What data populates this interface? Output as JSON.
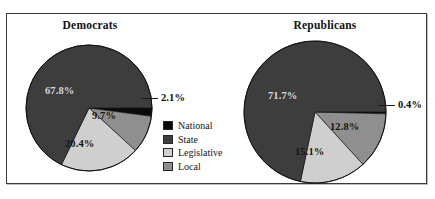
{
  "figure": {
    "background": "#ffffff",
    "frame_color": "#3a3a3a"
  },
  "legend": {
    "name": "chart-legend",
    "items": [
      {
        "label": "National",
        "color": "#0a0a0a"
      },
      {
        "label": "State",
        "color": "#3d3d3d"
      },
      {
        "label": "Legislative",
        "color": "#cfcfcf"
      },
      {
        "label": "Local",
        "color": "#8f8f8f"
      }
    ]
  },
  "charts": {
    "democrats": {
      "title": "Democrats",
      "labels": {
        "national": "2.1%",
        "local": "9.7%",
        "legislative": "20.4%",
        "state": "67.8%"
      }
    },
    "republicans": {
      "title": "Republicans",
      "labels": {
        "national": "0.4%",
        "local": "12.8%",
        "legislative": "15.1%",
        "state": "71.7%"
      }
    }
  },
  "chart_data": [
    {
      "type": "pie",
      "title": "Democrats",
      "categories": [
        "National",
        "Local",
        "Legislative",
        "State"
      ],
      "values": [
        2.1,
        9.7,
        20.4,
        67.8
      ],
      "value_labels": [
        "2.1%",
        "9.7%",
        "20.4%",
        "67.8%"
      ],
      "colors": [
        "#0a0a0a",
        "#8f8f8f",
        "#cfcfcf",
        "#3d3d3d"
      ],
      "units": "percent",
      "start_angle_deg": 0,
      "direction": "clockwise",
      "legend": [
        "National",
        "State",
        "Legislative",
        "Local"
      ],
      "legend_position": "center",
      "grid": false
    },
    {
      "type": "pie",
      "title": "Republicans",
      "categories": [
        "National",
        "Local",
        "Legislative",
        "State"
      ],
      "values": [
        0.4,
        12.8,
        15.1,
        71.7
      ],
      "value_labels": [
        "0.4%",
        "12.8%",
        "15.1%",
        "71.7%"
      ],
      "colors": [
        "#0a0a0a",
        "#8f8f8f",
        "#cfcfcf",
        "#3d3d3d"
      ],
      "units": "percent",
      "start_angle_deg": 0,
      "direction": "clockwise",
      "legend": [
        "National",
        "State",
        "Legislative",
        "Local"
      ],
      "legend_position": "center",
      "grid": false
    }
  ]
}
